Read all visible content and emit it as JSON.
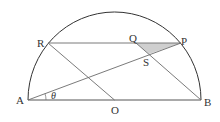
{
  "figure": {
    "colors": {
      "outline": "#333333",
      "lines": "#6b6b6b",
      "shade": "#cfcfcf"
    },
    "points": {
      "A": {
        "label": "A",
        "x": 28,
        "y": 100
      },
      "B": {
        "label": "B",
        "x": 201,
        "y": 100
      },
      "O": {
        "label": "O",
        "x": 114.5,
        "y": 100
      },
      "R": {
        "label": "R",
        "x": 48,
        "y": 43
      },
      "P": {
        "label": "P",
        "x": 181,
        "y": 43
      },
      "Q": {
        "label": "Q",
        "x": 136,
        "y": 43
      },
      "S": {
        "label": "S",
        "x": 149,
        "y": 54
      }
    },
    "angle_label": "θ"
  }
}
